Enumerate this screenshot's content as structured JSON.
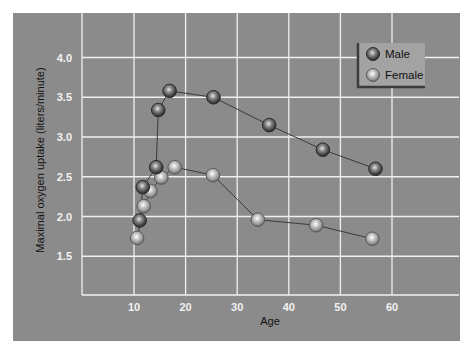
{
  "chart_data": {
    "type": "line",
    "title": "",
    "xlabel": "Age",
    "ylabel": "Maximal oxygen uptake (liters/minute)",
    "xlim": [
      0,
      73
    ],
    "ylim": [
      1.0,
      4.55
    ],
    "xticks": [
      10,
      20,
      30,
      40,
      50,
      60
    ],
    "yticks": [
      1.5,
      2.0,
      2.5,
      3.0,
      3.5,
      4.0
    ],
    "xtick_labels": [
      "10",
      "20",
      "30",
      "40",
      "50",
      "60"
    ],
    "ytick_labels": [
      "1.5",
      "2.0",
      "2.5",
      "3.0",
      "3.5",
      "4.0"
    ],
    "grid": true,
    "legend_position": "upper right",
    "series": [
      {
        "name": "Male",
        "color": "#3a3a3a",
        "x": [
          11.1,
          11.7,
          14.3,
          14.7,
          16.9,
          25.4,
          36.2,
          46.6,
          56.8
        ],
        "y": [
          1.95,
          2.37,
          2.62,
          3.34,
          3.58,
          3.5,
          3.15,
          2.84,
          2.6
        ]
      },
      {
        "name": "Female",
        "color": "#b5b5b5",
        "x": [
          10.6,
          11.9,
          13.2,
          15.3,
          17.9,
          25.3,
          34.0,
          45.3,
          56.2
        ],
        "y": [
          1.73,
          2.13,
          2.32,
          2.49,
          2.62,
          2.52,
          1.96,
          1.89,
          1.72
        ]
      }
    ]
  },
  "legend": {
    "items": [
      {
        "label": "Male"
      },
      {
        "label": "Female"
      }
    ]
  },
  "colors": {
    "panel_background": "#8b8b8b",
    "grid": "#f0f0f0",
    "line": "#3a3a3a"
  }
}
